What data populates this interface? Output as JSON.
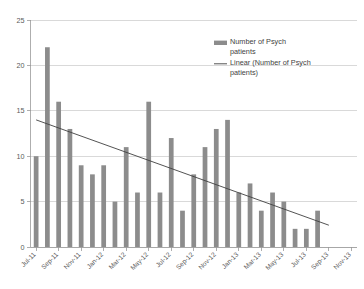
{
  "chart_data": {
    "type": "bar",
    "title": "",
    "xlabel": "",
    "ylabel": "",
    "ylim": [
      0,
      25
    ],
    "ytick_values": [
      0,
      5,
      10,
      15,
      20,
      25
    ],
    "ytick_labels": [
      "0",
      "5",
      "10",
      "15",
      "20",
      "25"
    ],
    "grid": true,
    "legend_position": "upper-right",
    "bar_color": "#8c8c8c",
    "trendline_color": "#404040",
    "gridline_color": "#c9c9c9",
    "axis_color": "#9a9a9a",
    "categories": [
      "Jul-11",
      "Aug-11",
      "Sep-11",
      "Oct-11",
      "Nov-11",
      "Dec-11",
      "Jan-12",
      "Feb-12",
      "Mar-12",
      "Apr-12",
      "May-12",
      "Jun-12",
      "Jul-12",
      "Aug-12",
      "Sep-12",
      "Oct-12",
      "Nov-12",
      "Dec-12",
      "Jan-13",
      "Feb-13",
      "Mar-13",
      "Apr-13",
      "May-13",
      "Jun-13",
      "Jul-13",
      "Aug-13",
      "Sep-13",
      "Oct-13",
      "Nov-13"
    ],
    "xtick_labels": [
      "Jul-11",
      "Sep-11",
      "Nov-11",
      "Jan-12",
      "Mar-12",
      "May-12",
      "Jul-12",
      "Sep-12",
      "Nov-12",
      "Jan-13",
      "Mar-13",
      "May-13",
      "Jul-13",
      "Sep-13",
      "Nov-13"
    ],
    "series": [
      {
        "name": "Number of Psych patients",
        "type": "bar",
        "values": [
          10,
          22,
          16,
          13,
          9,
          8,
          9,
          5,
          11,
          6,
          16,
          6,
          12,
          4,
          8,
          11,
          13,
          14,
          6,
          7,
          4,
          6,
          5,
          2,
          2,
          4,
          null,
          null,
          null
        ]
      },
      {
        "name": "Linear (Number of Psych patients)",
        "type": "line",
        "trendline": true,
        "start_value": 14.0,
        "end_value": 2.4
      }
    ]
  },
  "legend": {
    "items": [
      {
        "label_line1": "Number of Psych",
        "label_line2": "patients",
        "marker": "bar-swatch"
      },
      {
        "label_line1": "Linear (Number of Psych",
        "label_line2": "patients)",
        "marker": "line-swatch"
      }
    ]
  }
}
